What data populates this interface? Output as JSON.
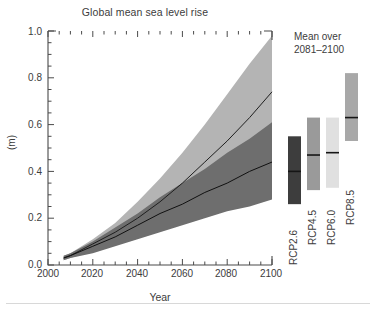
{
  "chart_data": {
    "type": "area",
    "title": "Global mean sea level rise",
    "xlabel": "Year",
    "ylabel": "(m)",
    "xlim": [
      2000,
      2100
    ],
    "ylim": [
      0.0,
      1.0
    ],
    "xticks": [
      2000,
      2020,
      2040,
      2060,
      2080,
      2100
    ],
    "xtick_labels": [
      "2000",
      "2020",
      "2040",
      "2060",
      "2080",
      "2100"
    ],
    "yticks": [
      0.0,
      0.2,
      0.4,
      0.6,
      0.8,
      1.0
    ],
    "ytick_labels": [
      "0.0",
      "0.2",
      "0.4",
      "0.6",
      "0.8",
      "1.0"
    ],
    "minor_tick_step": 0.05,
    "grid": false,
    "legend_position": "right",
    "x": [
      2007,
      2010,
      2020,
      2030,
      2040,
      2050,
      2060,
      2070,
      2080,
      2090,
      2100
    ],
    "series": [
      {
        "name": "RCP2.6",
        "color": "#6e6e6e",
        "median": [
          0.03,
          0.04,
          0.08,
          0.12,
          0.17,
          0.22,
          0.26,
          0.31,
          0.35,
          0.4,
          0.44
        ],
        "lower": [
          0.02,
          0.03,
          0.05,
          0.08,
          0.11,
          0.14,
          0.17,
          0.2,
          0.23,
          0.25,
          0.28
        ],
        "upper": [
          0.04,
          0.05,
          0.1,
          0.16,
          0.22,
          0.29,
          0.35,
          0.41,
          0.48,
          0.54,
          0.61
        ]
      },
      {
        "name": "RCP8.5",
        "color": "#b4b4b4",
        "median": [
          0.03,
          0.04,
          0.09,
          0.14,
          0.2,
          0.27,
          0.35,
          0.44,
          0.53,
          0.63,
          0.74
        ],
        "lower": [
          0.02,
          0.03,
          0.06,
          0.09,
          0.12,
          0.16,
          0.2,
          0.24,
          0.29,
          0.33,
          0.38
        ],
        "upper": [
          0.04,
          0.05,
          0.11,
          0.18,
          0.27,
          0.37,
          0.48,
          0.6,
          0.73,
          0.86,
          0.98
        ]
      }
    ],
    "legend_title_line1": "Mean over",
    "legend_title_line2": "2081–2100",
    "range_bars": [
      {
        "label": "RCP2.6",
        "low": 0.26,
        "high": 0.55,
        "median": 0.4,
        "color": "#3d3d3d"
      },
      {
        "label": "RCP4.5",
        "low": 0.32,
        "high": 0.63,
        "median": 0.47,
        "color": "#9a9a9a"
      },
      {
        "label": "RCP6.0",
        "low": 0.33,
        "high": 0.63,
        "median": 0.48,
        "color": "#e0e0e0"
      },
      {
        "label": "RCP8.5",
        "low": 0.53,
        "high": 0.82,
        "median": 0.63,
        "color": "#a8a8a8"
      }
    ],
    "colors": {
      "axis": "#4a4a4a",
      "text": "#3c3c3c",
      "band_dark": "#6e6e6e",
      "band_light": "#b4b4b4",
      "median_line": "#1a1a1a",
      "background": "#ffffff"
    }
  }
}
